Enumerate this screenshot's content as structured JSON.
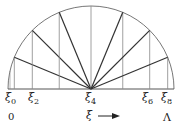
{
  "diagram": {
    "type": "semicircle-partition",
    "center": {
      "x": 91,
      "y": 89
    },
    "radius": 83,
    "divisions": 8,
    "stroke_color": "#555555",
    "arc_color": "#777777"
  },
  "labels": {
    "xi0": {
      "base": "ξ",
      "sub": "0"
    },
    "xi2": {
      "base": "ξ",
      "sub": "2"
    },
    "xi4": {
      "base": "ξ",
      "sub": "4"
    },
    "xi6": {
      "base": "ξ",
      "sub": "6"
    },
    "xi8": {
      "base": "ξ",
      "sub": "8"
    },
    "axis_var": "ξ",
    "start": "0",
    "end": "Λ"
  }
}
